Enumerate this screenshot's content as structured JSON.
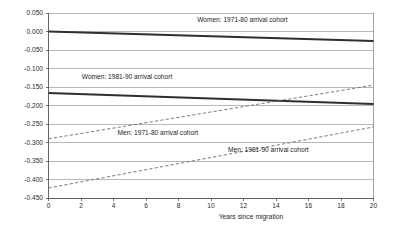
{
  "chart_data": {
    "type": "line",
    "title": "",
    "xlabel": "Years since migration",
    "ylabel": "",
    "xlim": [
      0,
      20
    ],
    "ylim": [
      -0.45,
      0.05
    ],
    "grid": true,
    "legend_position": "inline-annotations",
    "x_ticks": [
      0,
      2,
      4,
      6,
      8,
      10,
      12,
      14,
      16,
      18,
      20
    ],
    "x_tick_labels": [
      "0",
      "2",
      "4",
      "6",
      "8",
      "10",
      "12",
      "14",
      "16",
      "18",
      "20"
    ],
    "y_ticks": [
      0.05,
      0.0,
      -0.05,
      -0.1,
      -0.15,
      -0.2,
      -0.25,
      -0.3,
      -0.35,
      -0.4,
      -0.45
    ],
    "y_tick_labels": [
      "0.050",
      "0.000",
      "-0.050",
      "-0.100",
      "-0.150",
      "-0.200",
      "-0.250",
      "-0.300",
      "-0.350",
      "-0.400",
      "-0.450"
    ],
    "x": [
      0,
      20
    ],
    "series": [
      {
        "name": "Women: 1971-80 arrival cohort",
        "style": "solid",
        "color": "#2f2f2f",
        "values": [
          0.0,
          -0.026
        ],
        "label_x": 9.15,
        "label_y": 0.03
      },
      {
        "name": "Women: 1981-90 arrival cohort",
        "style": "solid",
        "color": "#2f2f2f",
        "values": [
          -0.166,
          -0.196
        ],
        "label_x": 2.05,
        "label_y": -0.123
      },
      {
        "name": "Men: 1971-80 arrival cohort",
        "style": "dashed",
        "color": "#6b6b6b",
        "values": [
          -0.29,
          -0.145
        ],
        "label_x": 4.25,
        "label_y": -0.276
      },
      {
        "name": "Men: 1981-90 arrival cohort",
        "style": "dashed",
        "color": "#6b6b6b",
        "values": [
          -0.423,
          -0.258
        ],
        "label_x": 11.05,
        "label_y": -0.322
      }
    ]
  }
}
